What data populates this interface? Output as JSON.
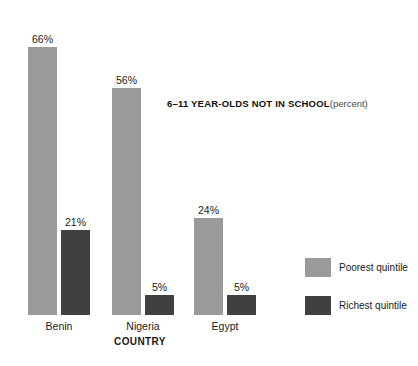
{
  "chart_data": {
    "type": "bar",
    "title": "6–11 YEAR-OLDS NOT IN SCHOOL",
    "title_unit": "(percent)",
    "xlabel": "COUNTRY",
    "ylabel": "",
    "ylim": [
      0,
      70
    ],
    "grid": false,
    "legend_position": "right",
    "categories": [
      "Benin",
      "Nigeria",
      "Egypt"
    ],
    "series": [
      {
        "name": "Poorest quintile",
        "color": "#9a9a9a",
        "values": [
          66,
          56,
          24
        ],
        "value_labels": [
          "66%",
          "56%",
          "24%"
        ]
      },
      {
        "name": "Richest quintile",
        "color": "#404040",
        "values": [
          21,
          5,
          5
        ],
        "value_labels": [
          "21%",
          "5%",
          "5%"
        ]
      }
    ]
  },
  "legend": {
    "items": [
      {
        "label": "Poorest quintile",
        "color": "#9a9a9a"
      },
      {
        "label": "Richest quintile",
        "color": "#404040"
      }
    ]
  },
  "axis": {
    "x_title": "COUNTRY",
    "tick_labels": [
      "Benin",
      "Nigeria",
      "Egypt"
    ]
  }
}
